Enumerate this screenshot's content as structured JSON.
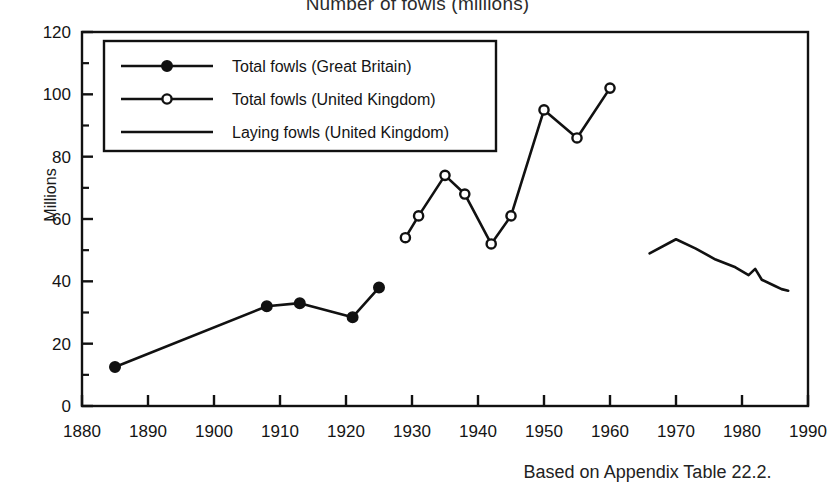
{
  "chart_data": {
    "type": "line",
    "title": "Number of fowls (millions)",
    "xlabel": "",
    "ylabel": "Millions",
    "caption": "Based on Appendix Table 22.2.",
    "xlim": [
      1880,
      1990
    ],
    "ylim": [
      0,
      120
    ],
    "xticks": [
      1880,
      1890,
      1900,
      1910,
      1920,
      1930,
      1940,
      1950,
      1960,
      1970,
      1980,
      1990
    ],
    "yticks": [
      0,
      20,
      40,
      60,
      80,
      100,
      120
    ],
    "y_minor_step": 10,
    "x_minor_step": 5,
    "grid": false,
    "legend_position": "upper-left",
    "series": [
      {
        "name": "Total fowls (Great Britain)",
        "marker": "filled-circle",
        "color": "#111111",
        "points": [
          {
            "x": 1885,
            "y": 12.5
          },
          {
            "x": 1908,
            "y": 32.0
          },
          {
            "x": 1913,
            "y": 33.0
          },
          {
            "x": 1921,
            "y": 28.5
          },
          {
            "x": 1925,
            "y": 38.0
          }
        ]
      },
      {
        "name": "Total fowls (United Kingdom)",
        "marker": "open-circle",
        "color": "#111111",
        "points": [
          {
            "x": 1929,
            "y": 54.0
          },
          {
            "x": 1931,
            "y": 61.0
          },
          {
            "x": 1935,
            "y": 74.0
          },
          {
            "x": 1938,
            "y": 68.0
          },
          {
            "x": 1942,
            "y": 52.0
          },
          {
            "x": 1945,
            "y": 61.0
          },
          {
            "x": 1950,
            "y": 95.0
          },
          {
            "x": 1955,
            "y": 86.0
          },
          {
            "x": 1960,
            "y": 102.0
          }
        ]
      },
      {
        "name": "Laying fowls (United Kingdom)",
        "marker": "none",
        "color": "#111111",
        "points": [
          {
            "x": 1966,
            "y": 49.0
          },
          {
            "x": 1970,
            "y": 53.5
          },
          {
            "x": 1973,
            "y": 50.5
          },
          {
            "x": 1976,
            "y": 47.0
          },
          {
            "x": 1979,
            "y": 44.5
          },
          {
            "x": 1981,
            "y": 42.0
          },
          {
            "x": 1982,
            "y": 44.0
          },
          {
            "x": 1983,
            "y": 40.5
          },
          {
            "x": 1985,
            "y": 38.5
          },
          {
            "x": 1986,
            "y": 37.5
          },
          {
            "x": 1987,
            "y": 37.0
          }
        ]
      }
    ]
  },
  "legend": {
    "entries": [
      "Total fowls (Great Britain)",
      "Total fowls (United Kingdom)",
      "Laying fowls (United Kingdom)"
    ]
  },
  "axes": {
    "y_title": "Millions",
    "x_tick_labels": [
      "1880",
      "1890",
      "1900",
      "1910",
      "1920",
      "1930",
      "1940",
      "1950",
      "1960",
      "1970",
      "1980",
      "1990"
    ],
    "y_tick_labels": [
      "0",
      "20",
      "40",
      "60",
      "80",
      "100",
      "120"
    ]
  },
  "footer": {
    "source_note": "Based on Appendix Table 22.2."
  },
  "colors": {
    "ink": "#111111",
    "background": "#ffffff"
  }
}
